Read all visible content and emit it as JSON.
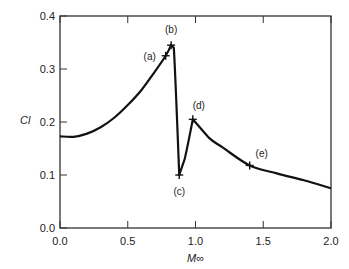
{
  "chart_data": {
    "type": "line",
    "title": "",
    "xlabel": "M∞",
    "ylabel": "Cl",
    "xlim": [
      0.0,
      2.0
    ],
    "ylim": [
      0.0,
      0.4
    ],
    "xticks": [
      "0.0",
      "0.5",
      "1.0",
      "1.5",
      "2.0"
    ],
    "yticks": [
      "0.0",
      "0.1",
      "0.2",
      "0.3",
      "0.4"
    ],
    "grid": false,
    "x": [
      0.0,
      0.1,
      0.2,
      0.3,
      0.4,
      0.5,
      0.6,
      0.7,
      0.78,
      0.82,
      0.84,
      0.88,
      0.92,
      0.98,
      1.1,
      1.2,
      1.4,
      1.6,
      1.8,
      2.0
    ],
    "y": [
      0.173,
      0.172,
      0.178,
      0.19,
      0.208,
      0.232,
      0.26,
      0.295,
      0.325,
      0.345,
      0.34,
      0.1,
      0.13,
      0.205,
      0.17,
      0.152,
      0.118,
      0.103,
      0.09,
      0.075
    ],
    "annotations": [
      {
        "label": "(a)",
        "x": 0.78,
        "y": 0.325
      },
      {
        "label": "(b)",
        "x": 0.82,
        "y": 0.345
      },
      {
        "label": "(c)",
        "x": 0.88,
        "y": 0.1
      },
      {
        "label": "(d)",
        "x": 0.98,
        "y": 0.205
      },
      {
        "label": "(e)",
        "x": 1.4,
        "y": 0.118
      }
    ]
  }
}
